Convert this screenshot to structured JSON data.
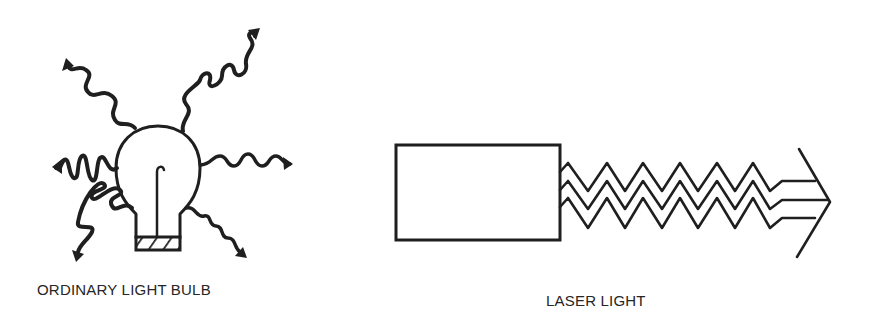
{
  "figure": {
    "left_panel": {
      "caption": "ORDINARY LIGHT BULB",
      "description": "Light bulb emitting wavy rays in many directions"
    },
    "right_panel": {
      "caption": "LASER LIGHT",
      "description": "Rectangular laser source emitting three parallel in-phase zigzag waves ending in an arrow"
    },
    "colors": {
      "ink": "#1f1f1f",
      "background": "#ffffff"
    }
  }
}
